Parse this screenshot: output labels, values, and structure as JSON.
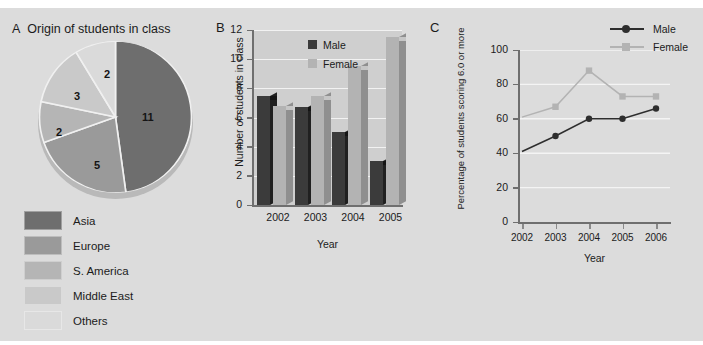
{
  "figure": {
    "background": "#dcdcdc",
    "panels": [
      "A",
      "B",
      "C"
    ]
  },
  "panel_a": {
    "letter": "A",
    "title": "Origin of students in class",
    "legend": [
      {
        "label": "Asia",
        "color": "#6e6e6e"
      },
      {
        "label": "Europe",
        "color": "#9a9a9a"
      },
      {
        "label": "S. America",
        "color": "#b5b5b5"
      },
      {
        "label": "Middle East",
        "color": "#c9c9c9"
      },
      {
        "label": "Others",
        "color": "#dadada"
      }
    ]
  },
  "panel_b": {
    "letter": "B",
    "legend": [
      {
        "label": "Male",
        "color": "#3b3b3b"
      },
      {
        "label": "Female",
        "color": "#b3b3b3"
      }
    ]
  },
  "panel_c": {
    "letter": "C",
    "legend": [
      {
        "label": "Male",
        "color": "#2e2e2e",
        "marker": "circle"
      },
      {
        "label": "Female",
        "color": "#b3b3b3",
        "marker": "square"
      }
    ]
  },
  "chart_data": [
    {
      "panel": "A",
      "type": "pie",
      "title": "Origin of students in class",
      "categories": [
        "Asia",
        "Europe",
        "S. America",
        "Middle East",
        "Others"
      ],
      "values": [
        11,
        5,
        2,
        3,
        2
      ],
      "total": 23,
      "data_labels": [
        "11",
        "5",
        "2",
        "3",
        "2"
      ],
      "colors": [
        "#6e6e6e",
        "#9a9a9a",
        "#b5b5b5",
        "#c9c9c9",
        "#dadada"
      ],
      "legend_position": "below",
      "grid": false
    },
    {
      "panel": "B",
      "type": "bar",
      "title": "",
      "xlabel": "Year",
      "ylabel": "Number of students in class",
      "categories": [
        "2002",
        "2003",
        "2004",
        "2005"
      ],
      "ylim": [
        0,
        12
      ],
      "yticks": [
        0,
        2,
        4,
        6,
        8,
        10,
        12
      ],
      "grid": true,
      "legend_position": "top-center",
      "series": [
        {
          "name": "Male",
          "color": "#3b3b3b",
          "values": [
            7.5,
            6.7,
            5.0,
            3.0
          ]
        },
        {
          "name": "Female",
          "color": "#b3b3b3",
          "values": [
            6.8,
            7.5,
            9.5,
            11.5
          ]
        }
      ]
    },
    {
      "panel": "C",
      "type": "line",
      "title": "",
      "xlabel": "Year",
      "ylabel": "Percentage of students scoring 6.0 or more",
      "x": [
        "2002",
        "2003",
        "2004",
        "2005",
        "2006"
      ],
      "ylim": [
        0,
        100
      ],
      "yticks": [
        0,
        20,
        40,
        60,
        80,
        100
      ],
      "grid": true,
      "legend_position": "top-right",
      "series": [
        {
          "name": "Male",
          "color": "#2e2e2e",
          "marker": "circle",
          "values": [
            41,
            50,
            60,
            60,
            66
          ],
          "markers_shown": [
            false,
            true,
            true,
            true,
            true
          ]
        },
        {
          "name": "Female",
          "color": "#b3b3b3",
          "marker": "square",
          "values": [
            61,
            67,
            88,
            73,
            73
          ],
          "markers_shown": [
            false,
            true,
            true,
            true,
            true
          ]
        }
      ]
    }
  ]
}
